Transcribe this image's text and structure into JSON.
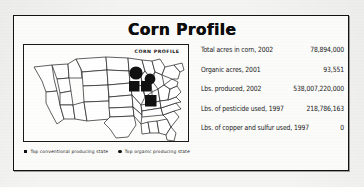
{
  "card": {
    "title": "Corn Profile"
  },
  "map": {
    "caption": "CORN PROFILE",
    "alt": "Outline map of the contiguous United States with markers over the Midwest",
    "markers": [
      {
        "state": "Minnesota",
        "type": "circle",
        "role": "top-organic-producing-state"
      },
      {
        "state": "Wisconsin",
        "type": "circle",
        "role": "top-organic-producing-state"
      },
      {
        "state": "Iowa",
        "type": "square",
        "role": "top-conventional-producing-state"
      },
      {
        "state": "Illinois",
        "type": "square",
        "role": "top-conventional-producing-state"
      },
      {
        "state": "Nebraska",
        "type": "square",
        "role": "top-conventional-producing-state"
      },
      {
        "state": "Missouri",
        "type": "square",
        "role": "top-conventional-producing-state"
      }
    ]
  },
  "legend": {
    "conventional": "Top conventional producing state",
    "organic": "Top organic producing state"
  },
  "stats": [
    {
      "label": "Total acres in corn, 2002",
      "value": "78,894,000"
    },
    {
      "label": "Organic acres, 2001",
      "value": "93,551"
    },
    {
      "label": "Lbs. produced, 2002",
      "value": "538,007,220,000"
    },
    {
      "label": "Lbs. of pesticide used, 1997",
      "value": "218,786,163"
    },
    {
      "label": "Lbs. of copper and sulfur used, 1997",
      "value": "0"
    }
  ],
  "colors": {
    "ink": "#121212",
    "paper": "#f4f4f2",
    "marker": "#111111"
  }
}
